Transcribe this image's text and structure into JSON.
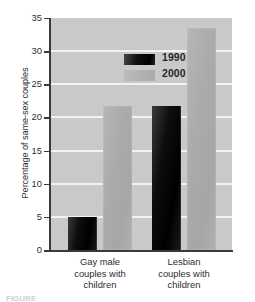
{
  "chart_data": {
    "type": "bar",
    "title": "",
    "xlabel": "",
    "ylabel": "Percentage of same-sex couples",
    "categories": [
      "Gay male couples with children",
      "Lesbian couples with children"
    ],
    "series": [
      {
        "name": "1990",
        "values": [
          5.0,
          21.7
        ],
        "color": "#000000"
      },
      {
        "name": "2000",
        "values": [
          21.7,
          33.5
        ],
        "color": "#ababab"
      }
    ],
    "ylim": [
      0,
      35
    ],
    "yticks": [
      0,
      5,
      10,
      15,
      20,
      25,
      30,
      35
    ],
    "ytick_labels": [
      "0",
      "5",
      "10",
      "15",
      "20",
      "25",
      "30",
      "35"
    ],
    "grid": true,
    "grid_color": "#f2f2f2",
    "plot_background": "#c9c9c9",
    "legend_position": "upper-left-inside",
    "legend_entries": [
      "1990",
      "2000"
    ]
  },
  "category_lines": [
    [
      "Gay male",
      "couples with",
      "children"
    ],
    [
      "Lesbian",
      "couples with",
      "children"
    ]
  ],
  "caption_fragment": "FIGURE"
}
